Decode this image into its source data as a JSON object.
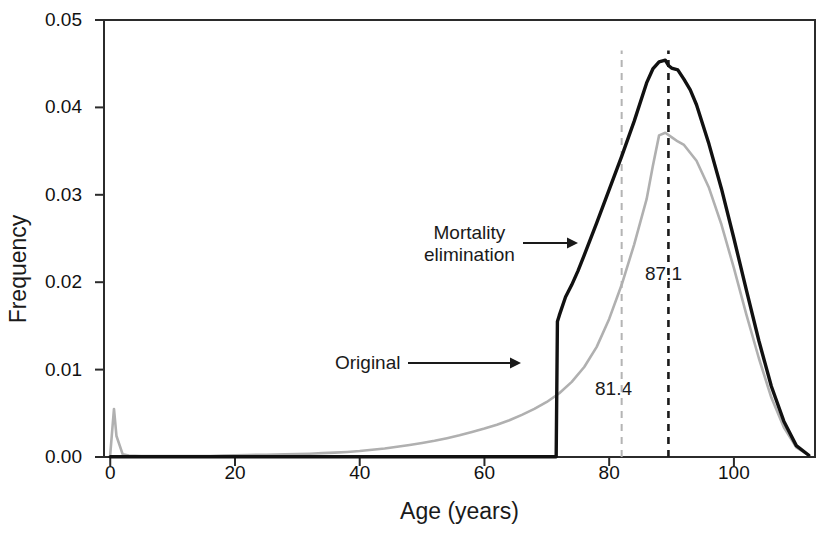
{
  "chart_data": {
    "type": "line",
    "title": "",
    "xlabel": "Age (years)",
    "ylabel": "Frequency",
    "xlim": [
      -1,
      113
    ],
    "ylim": [
      0.0,
      0.05
    ],
    "xticks": [
      0,
      20,
      40,
      60,
      80,
      100
    ],
    "xtick_labels": [
      "0",
      "20",
      "40",
      "60",
      "80",
      "100"
    ],
    "yticks": [
      0.0,
      0.01,
      0.02,
      0.03,
      0.04,
      0.05
    ],
    "ytick_labels": [
      "0.00",
      "0.01",
      "0.02",
      "0.03",
      "0.04",
      "0.05"
    ],
    "grid": false,
    "legend_position": "inline-annotations",
    "annotations": [
      {
        "name": "mortality-elimination",
        "text_line1": "Mortality",
        "text_line2": "elimination",
        "arrow": "right",
        "points_to_series": "Mortality elimination"
      },
      {
        "name": "original",
        "text_line1": "Original",
        "text_line2": "",
        "arrow": "right",
        "points_to_series": "Original"
      },
      {
        "name": "mean-mortality-elimination",
        "text": "87.1",
        "vline_x": 89.5,
        "vline_color": "#1a1a1a",
        "vline_style": "dashed"
      },
      {
        "name": "mean-original",
        "text": "81.4",
        "vline_x": 82.0,
        "vline_color": "#b4b4b4",
        "vline_style": "dashed"
      }
    ],
    "series": [
      {
        "name": "Original",
        "color": "#b0b0b0",
        "style": "solid",
        "mean": 81.4,
        "peak_x": 88.0,
        "peak_y": 0.0371,
        "x": [
          0,
          0.6,
          1,
          2,
          3,
          5,
          8,
          12,
          16,
          18,
          20,
          22,
          25,
          28,
          30,
          32,
          34,
          36,
          38,
          40,
          42,
          44,
          46,
          48,
          50,
          52,
          54,
          56,
          58,
          60,
          62,
          64,
          66,
          68,
          70,
          72,
          74,
          76,
          78,
          80,
          82,
          84,
          86,
          87,
          88,
          89,
          90,
          91,
          92,
          94,
          96,
          98,
          100,
          102,
          104,
          106,
          108,
          110,
          112
        ],
        "y": [
          0.0003,
          0.0055,
          0.0024,
          0.0003,
          0.00018,
          0.00012,
          0.0001,
          0.0001,
          0.00012,
          0.00016,
          0.0002,
          0.00023,
          0.00026,
          0.0003,
          0.00034,
          0.00038,
          0.00044,
          0.0005,
          0.00058,
          0.00068,
          0.00082,
          0.00098,
          0.00118,
          0.00138,
          0.0016,
          0.00185,
          0.00215,
          0.00248,
          0.00285,
          0.00325,
          0.0037,
          0.0042,
          0.00482,
          0.0055,
          0.0063,
          0.0073,
          0.0086,
          0.0103,
          0.0126,
          0.0158,
          0.0197,
          0.0243,
          0.0295,
          0.0333,
          0.0368,
          0.0371,
          0.0366,
          0.0361,
          0.0357,
          0.0339,
          0.0308,
          0.0266,
          0.0216,
          0.0163,
          0.0113,
          0.0068,
          0.0034,
          0.0011,
          0.0002
        ]
      },
      {
        "name": "Mortality elimination",
        "color": "#111111",
        "style": "solid",
        "mean": 87.1,
        "peak_x": 89.5,
        "peak_y": 0.0454,
        "onset_x": 71.7,
        "onset_y": 0.0155,
        "x": [
          0,
          30,
          50,
          60,
          68,
          71.5,
          71.7,
          72,
          73,
          74,
          75,
          76,
          78,
          80,
          82,
          84,
          86,
          87,
          88,
          89,
          89.5,
          90,
          91,
          92,
          93,
          94,
          96,
          98,
          100,
          102,
          104,
          106,
          108,
          110,
          112
        ],
        "y": [
          3e-05,
          3e-05,
          3e-05,
          3e-05,
          3e-05,
          3e-05,
          0.0155,
          0.0162,
          0.0183,
          0.0197,
          0.0213,
          0.0231,
          0.0268,
          0.0306,
          0.0344,
          0.0384,
          0.0428,
          0.0444,
          0.0452,
          0.0454,
          0.0448,
          0.0445,
          0.0443,
          0.0432,
          0.042,
          0.0403,
          0.0358,
          0.0307,
          0.025,
          0.0191,
          0.0133,
          0.0081,
          0.0041,
          0.0013,
          0.0002
        ]
      }
    ]
  }
}
